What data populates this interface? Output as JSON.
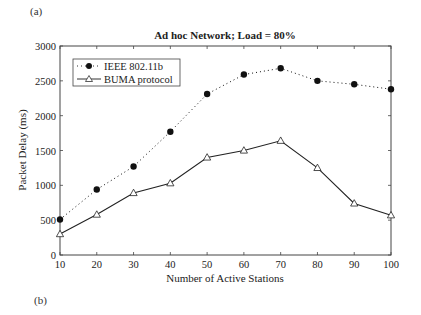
{
  "panel_labels": {
    "top": "(a)",
    "bottom": "(b)"
  },
  "chart_data": {
    "type": "line",
    "title": "Ad hoc Network; Load = 80%",
    "xlabel": "Number of Active Stations",
    "ylabel": "Packet Delay (ms)",
    "x": [
      10,
      20,
      30,
      40,
      50,
      60,
      70,
      80,
      90,
      100
    ],
    "xlim": [
      10,
      100
    ],
    "ylim": [
      0,
      3000
    ],
    "xticks": [
      10,
      20,
      30,
      40,
      50,
      60,
      70,
      80,
      90,
      100
    ],
    "yticks": [
      0,
      500,
      1000,
      1500,
      2000,
      2500,
      3000
    ],
    "grid": false,
    "legend_position": "upper left",
    "series": [
      {
        "name": "IEEE 802.11b",
        "style": "dotted",
        "marker": "filled-circle",
        "color": "#111111",
        "values": [
          510,
          940,
          1270,
          1770,
          2310,
          2590,
          2680,
          2500,
          2450,
          2380
        ]
      },
      {
        "name": "BUMA protocol",
        "style": "solid",
        "marker": "open-triangle",
        "color": "#222222",
        "values": [
          300,
          580,
          890,
          1030,
          1400,
          1500,
          1640,
          1250,
          740,
          570
        ]
      }
    ]
  }
}
